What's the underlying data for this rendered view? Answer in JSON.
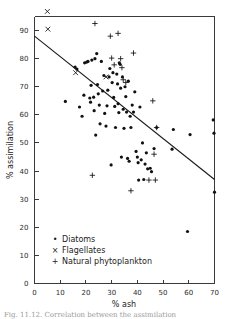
{
  "figure": {
    "caption": "Fig. 11.12.  Correlation between the assimilation"
  },
  "chart_data": {
    "type": "scatter",
    "title": "",
    "xlabel": "% ash",
    "ylabel": "% assimilation",
    "xlim": [
      0,
      70
    ],
    "ylim": [
      0,
      95
    ],
    "xticks": [
      0,
      10,
      20,
      30,
      40,
      50,
      60,
      70
    ],
    "yticks": [
      0,
      10,
      20,
      30,
      40,
      50,
      60,
      70,
      80,
      90
    ],
    "grid": false,
    "legend_position": "lower-left",
    "trend_line": {
      "name": "regression line",
      "x": [
        0,
        70
      ],
      "y": [
        88,
        37
      ]
    },
    "series": [
      {
        "name": "Diatoms",
        "marker": "dot",
        "legend_glyph": "•",
        "points": [
          [
            12.0,
            64.8
          ],
          [
            15.8,
            77.0
          ],
          [
            16.5,
            76.3
          ],
          [
            17.5,
            62.8
          ],
          [
            18.5,
            59.5
          ],
          [
            19.2,
            67.0
          ],
          [
            19.5,
            78.5
          ],
          [
            20.3,
            78.8
          ],
          [
            20.8,
            79.0
          ],
          [
            21.5,
            66.0
          ],
          [
            21.8,
            64.5
          ],
          [
            22.0,
            70.5
          ],
          [
            22.3,
            79.5
          ],
          [
            23.0,
            66.3
          ],
          [
            23.2,
            61.5
          ],
          [
            23.5,
            80.0
          ],
          [
            23.8,
            52.8
          ],
          [
            24.2,
            81.8
          ],
          [
            24.5,
            70.8
          ],
          [
            24.8,
            67.5
          ],
          [
            25.2,
            63.5
          ],
          [
            25.5,
            56.8
          ],
          [
            26.0,
            79.0
          ],
          [
            26.5,
            68.5
          ],
          [
            27.0,
            74.0
          ],
          [
            27.3,
            60.5
          ],
          [
            27.8,
            56.0
          ],
          [
            28.2,
            63.2
          ],
          [
            28.5,
            68.8
          ],
          [
            29.0,
            73.5
          ],
          [
            29.3,
            76.5
          ],
          [
            29.8,
            42.2
          ],
          [
            30.2,
            71.5
          ],
          [
            30.5,
            75.0
          ],
          [
            30.8,
            66.2
          ],
          [
            31.2,
            63.0
          ],
          [
            31.5,
            55.5
          ],
          [
            32.0,
            74.5
          ],
          [
            32.3,
            71.0
          ],
          [
            32.5,
            64.0
          ],
          [
            32.8,
            60.8
          ],
          [
            33.0,
            78.5
          ],
          [
            33.3,
            78.0
          ],
          [
            33.5,
            69.5
          ],
          [
            33.8,
            45.0
          ],
          [
            34.2,
            73.5
          ],
          [
            34.5,
            62.0
          ],
          [
            34.8,
            55.2
          ],
          [
            35.2,
            70.0
          ],
          [
            35.5,
            66.5
          ],
          [
            35.8,
            61.0
          ],
          [
            36.2,
            44.5
          ],
          [
            36.5,
            72.0
          ],
          [
            36.8,
            43.5
          ],
          [
            37.2,
            59.5
          ],
          [
            37.5,
            55.5
          ],
          [
            38.0,
            63.5
          ],
          [
            38.5,
            61.0
          ],
          [
            39.0,
            68.2
          ],
          [
            39.5,
            47.0
          ],
          [
            40.0,
            45.0
          ],
          [
            40.3,
            43.0
          ],
          [
            40.5,
            36.8
          ],
          [
            41.0,
            62.8
          ],
          [
            41.5,
            44.0
          ],
          [
            42.0,
            50.0
          ],
          [
            42.5,
            37.0
          ],
          [
            43.0,
            42.5
          ],
          [
            43.5,
            46.5
          ],
          [
            44.0,
            40.8
          ],
          [
            45.0,
            41.0
          ],
          [
            45.5,
            39.8
          ],
          [
            46.5,
            48.0
          ],
          [
            47.5,
            55.5
          ],
          [
            53.5,
            47.8
          ],
          [
            54.0,
            54.8
          ],
          [
            59.5,
            18.5
          ],
          [
            60.5,
            53.0
          ],
          [
            69.5,
            58.2
          ],
          [
            69.8,
            53.5
          ],
          [
            70.0,
            32.5
          ]
        ]
      },
      {
        "name": "Flagellates",
        "marker": "x",
        "legend_glyph": "×",
        "points": [
          [
            5.0,
            96.8
          ],
          [
            5.2,
            90.5
          ],
          [
            16.0,
            75.0
          ],
          [
            27.8,
            73.5
          ]
        ]
      },
      {
        "name": "Natural phytoplankton",
        "marker": "plus",
        "legend_glyph": "+",
        "points": [
          [
            23.5,
            92.5
          ],
          [
            29.5,
            88.0
          ],
          [
            30.0,
            80.2
          ],
          [
            31.0,
            77.8
          ],
          [
            32.5,
            89.0
          ],
          [
            33.5,
            80.0
          ],
          [
            34.0,
            76.8
          ],
          [
            34.5,
            72.5
          ],
          [
            35.5,
            71.5
          ],
          [
            38.5,
            82.0
          ],
          [
            22.5,
            38.5
          ],
          [
            37.5,
            33.0
          ],
          [
            46.0,
            65.0
          ],
          [
            46.5,
            46.0
          ],
          [
            47.0,
            36.8
          ],
          [
            44.5,
            36.8
          ],
          [
            47.5,
            55.5
          ]
        ]
      }
    ]
  },
  "legend": {
    "items": [
      {
        "glyph": "•",
        "label": "Diatoms"
      },
      {
        "glyph": "×",
        "label": "Flagellates"
      },
      {
        "glyph": "+",
        "label": "Natural phytoplankton"
      }
    ]
  },
  "colors": {
    "marker": "#111111",
    "axis": "#3a3a3a",
    "line": "#1a1a1a",
    "background": "#ffffff",
    "caption": "#9a9a9a"
  }
}
